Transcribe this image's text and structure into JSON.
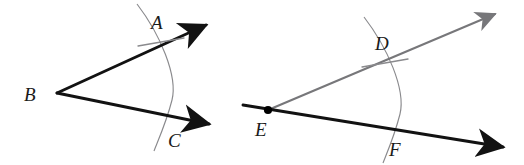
{
  "figure": {
    "background_color": "#ffffff",
    "stroke_colors": {
      "ray_black": "#121212",
      "ray_gray": "#77777a",
      "arc_gray": "#8a8a8d",
      "tick_gray": "#8a8a8d",
      "label_color": "#1a1a1a",
      "vertex_dot": "#000000"
    },
    "labels": {
      "A": "A",
      "B": "B",
      "C": "C",
      "D": "D",
      "E": "E",
      "F": "F"
    },
    "left_figure": {
      "name": "angle-ABC",
      "vertex_label": "B",
      "vertex": [
        57,
        93
      ],
      "upper_ray_end": [
        211,
        22
      ],
      "lower_ray_end": [
        214,
        124
      ],
      "arc_point_upper_label": "A",
      "arc_point_upper": [
        164,
        36
      ],
      "arc_point_lower_label": "C",
      "arc_point_lower": [
        170,
        124
      ],
      "arc_top": [
        138,
        5
      ],
      "arc_bottom": [
        155,
        150
      ],
      "arc_bulge": [
        174,
        78
      ],
      "tick_at": "A",
      "arrowheads": [
        "upper-ray",
        "lower-ray"
      ]
    },
    "right_figure": {
      "name": "angle-DEF",
      "vertex_label": "E",
      "vertex": [
        268,
        110
      ],
      "has_vertex_dot": true,
      "gray_ray_end": [
        500,
        10
      ],
      "black_line_start": [
        243,
        105
      ],
      "black_line_end": [
        508,
        148
      ],
      "arc_point_upper_label": "D",
      "arc_point_upper": [
        388,
        58
      ],
      "arc_point_lower_label": "F",
      "arc_point_lower": [
        392,
        138
      ],
      "arc_top": [
        365,
        18
      ],
      "arc_bottom": [
        384,
        162
      ],
      "arc_bulge": [
        405,
        90
      ],
      "tick_at": "D",
      "arrowheads": [
        "gray-ray",
        "black-line-right"
      ]
    }
  }
}
